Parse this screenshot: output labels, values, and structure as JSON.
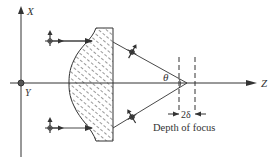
{
  "diagram": {
    "type": "optics-lens-focus",
    "axes": {
      "x_label": "X",
      "y_label": "Y",
      "z_label": "Z"
    },
    "angle_label": "θ",
    "depth_label": "2δ",
    "caption": "Depth of focus",
    "colors": {
      "line": "#333333",
      "background": "#ffffff"
    }
  }
}
